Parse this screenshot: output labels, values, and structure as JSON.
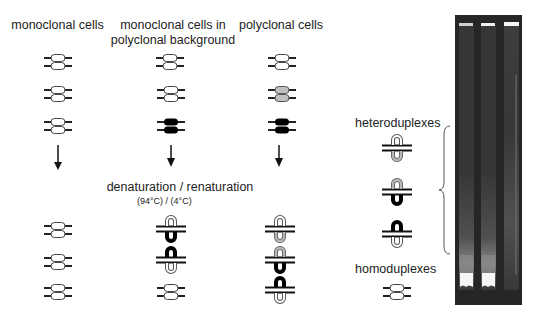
{
  "columns": [
    {
      "title": "monoclonal cells"
    },
    {
      "title": "monoclonal cells in polyclonal background"
    },
    {
      "title": "polyclonal cells"
    }
  ],
  "process": {
    "label": "denaturation / renaturation",
    "temps": "(94°C)   /     (4°C)"
  },
  "legend": {
    "heteroduplexes": "heteroduplexes",
    "homoduplexes": "homoduplexes"
  },
  "colors": {
    "white_allele": "#ffffff",
    "gray_allele": "#c0c0c0",
    "black_allele": "#000000",
    "gel_background": "#262626"
  },
  "gel": {
    "lanes": 3,
    "description": "heteroduplex analysis gel: lanes 1-2 strong homoduplex bands at bottom, lane 3 diffuse smear"
  }
}
